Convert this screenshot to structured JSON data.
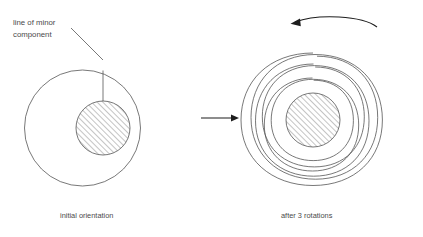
{
  "figure": {
    "annotation": {
      "label_line_1": "line of minor",
      "label_line_2": "component",
      "name": "line-of-minor-component-label"
    },
    "captions": {
      "left": "initial orientation",
      "right": "after 3 rotations"
    },
    "left_panel": {
      "outer_circle": {
        "cx": 82.5,
        "cy": 128,
        "r": 58
      },
      "inner_hatched_circle": {
        "cx": 103,
        "cy": 128,
        "r": 27
      },
      "marker_line": {
        "x": 103,
        "y_top": 70.5,
        "y_bottom": 101
      }
    },
    "right_panel": {
      "inner_hatched_circle": {
        "cx": 313,
        "cy": 120,
        "r": 27
      },
      "spiral_turns": 3,
      "spiral_outer_radius": 67,
      "spiral_inner_radius": 29
    },
    "transition_arrow": {
      "x1": 201,
      "y1": 118,
      "x2": 238,
      "y2": 118
    },
    "rotation_arrow": {
      "direction": "counterclockwise"
    },
    "colors": {
      "background": "#ffffff",
      "line": "#555555",
      "arrow": "#1d1d1d",
      "text": "#4a4a4a",
      "hatch": "#4a4a4a"
    }
  }
}
